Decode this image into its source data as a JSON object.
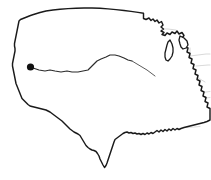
{
  "figure": {
    "name": "us-contiguous-map",
    "background_color": "#ffffff",
    "width": 211,
    "height": 180
  },
  "style": {
    "national_outline_color": "#1a1a1a",
    "state_border_color": "#c9c9c9",
    "marker_color": "#111111",
    "route_color": "#2b2b2b",
    "route_color_faint": "#5c5c5c",
    "lake_outline_color": "#1a1a1a"
  },
  "markers": [
    {
      "name": "location-dot",
      "label": "",
      "x": 30.5,
      "y": 67.0,
      "radius": 3.6,
      "color": "#111111"
    }
  ],
  "routes": [
    {
      "name": "eastward-route",
      "label": "",
      "color": "#2b2b2b",
      "points": "33,68 39,70 45,71 50,70 55,71 61,72 67,71 72,72 78,72 83,71 88,70 93,65 97,61 101,59 106,57 110,55 115,55 119,56 124,58 128,60 132,61"
    },
    {
      "name": "eastward-route-tail",
      "label": "",
      "color": "#5c5c5c",
      "points": "132,61 137,64 142,67 147,70 151,73 155,76"
    }
  ],
  "geography": {
    "national_outline": "M 33.5,14.5 L 40,12.5 L 46,11.0 L 53,10.0 L 60,9.2 L 68,8.6 L 76,8.2 L 84,8.0 L 92,8.0 L 100,8.3 L 108,8.9 L 116,9.6 L 124,10.5 L 131,11.4 L 138,12.4 L 143.5,13.2 L 143.5,18.5 L 146,19.5 L 149,18.0 L 151,20.5 L 153,19.0 L 155,21.5 L 157,20.0 L 159,23.0 L 161.5,21.5 L 163,25.0 L 161,27.0 L 163.5,29.0 L 161,31.0 L 164,32.5 L 162,34.5 L 165,35.5 L 167,33.0 L 170,34.5 L 172,32.0 L 175,33.5 L 177,31.0 L 179,34.0 L 182,32.5 L 184,35.5 L 182,38.0 L 184.5,39.5 L 183,42.5 L 186,43.5 L 185,47.0 L 188,48.0 L 187,52.0 L 190,53.5 L 189,57.5 L 192,59.0 L 191,63.0 L 194,64.5 L 193,68.5 L 196,70.0 L 195,74.0 L 198,75.5 L 197,79.5 L 200,81.0 L 199,85.0 L 202,86.5 L 201,90.5 L 204,92.0 L 203,96.0 L 206,97.5 L 205,101.5 L 208,103.0 L 207,107.0 L 210,108.5 L 210,120.0 L 207,121.5 L 204,122.5 L 200,123.5 L 196,124.5 L 192,125.5 L 188,126.5 L 184,127.5 L 181,128.5 L 179,129.5 L 177,128.5 L 175,130.0 L 173,128.5 L 171,130.5 L 169,129.0 L 167,131.0 L 165,129.5 L 163,131.5 L 161,130.0 L 159,132.0 L 157,130.5 L 155,132.0 L 153,133.5 L 151,132.5 L 149,134.0 L 147,133.0 L 145,134.5 L 143,133.5 L 141,134.5 L 139,133.5 L 137,134.0 L 135,133.0 L 133,133.5 L 131,132.5 L 129,133.0 L 127,132.0 L 125,132.5 L 123,133.5 L 121,135.0 L 119,136.5 L 117,138.0 L 115,139.5 L 114,142.0 L 113,145.0 L 112,148.0 L 111,151.0 L 110,154.0 L 109,157.0 L 108,160.0 L 107,163.0 L 106,165.5 L 104.5,167.5 L 103,165.0 L 101.5,162.0 L 100,159.0 L 99,156.0 L 97.5,153.5 L 96,151.5 L 94,150.5 L 92,150.0 L 90,149.0 L 88,147.5 L 86,145.5 L 84.5,143.0 L 83,140.5 L 81.5,138.0 L 80,135.5 L 78,134.0 L 76,133.0 L 74,132.0 L 72,130.5 L 70,129.0 L 68,127.0 L 66,125.0 L 64,123.0 L 62,121.0 L 60,119.5 L 58,118.0 L 56,116.5 L 54,115.0 L 52,113.5 L 50,112.0 L 48,111.0 L 46,110.0 L 44,109.5 L 42,109.0 L 40,108.5 L 38,108.0 L 36,107.5 L 34,107.0 L 32,106.5 L 30,106.0 L 28,104.5 L 26,102.5 L 24,100.5 L 22,98.5 L 21,96.0 L 20,93.5 L 19,91.0 L 18,88.5 L 17,86.0 L 16,83.5 L 15.5,81.0 L 15,78.5 L 14.5,76.0 L 14,73.5 L 13.5,71.0 L 13,68.5 L 12.5,66.0 L 12.5,63.5 L 13,61.0 L 13.5,58.5 L 14,56.0 L 14.5,53.5 L 15,51.0 L 15,48.5 L 14.5,46.0 L 14.5,43.5 L 15,41.0 L 15.5,38.5 L 16,36.0 L 16.5,33.5 L 17,31.0 L 17.5,28.5 L 18,26.0 L 18.5,23.5 L 19,21.0 L 20.5,19.5 L 23,18.5 L 25.5,17.5 L 28,16.5 L 30.5,15.5 Z",
    "border_lines": [
      {
        "name": "wa-or-border",
        "d": "M 15,41 L 22,40.5 L 30,40 L 38,39.5 L 45,39.2"
      },
      {
        "name": "or-ca-border",
        "d": "M 14,57.5 L 22,57 L 30,56.8 L 38,56.6 L 45,56.4"
      },
      {
        "name": "wa-id-border",
        "d": "M 45,39.2 L 45.5,30 L 46,22 L 46.5,15.5"
      },
      {
        "name": "id-mt-border",
        "d": "M 45,39.2 L 48,38 L 52,36 L 55,33 L 57,29 L 58.5,25 L 59.5,20 L 60,14.5"
      },
      {
        "name": "id-nv-ut-border",
        "d": "M 45,56.4 L 52,56.2 L 59,56 L 66,55.8 L 72,55.6"
      },
      {
        "name": "nv-ca-border",
        "d": "M 45,56.4 L 42,63 L 39,69 L 36,76 L 33,82 L 30,89 L 27,95 L 25,100"
      },
      {
        "name": "nv-ut-border",
        "d": "M 72,55.6 L 72,64 L 72,72 L 72,80 L 72,88"
      },
      {
        "name": "ut-az-border",
        "d": "M 72,88 L 66,88.2 L 60,88.4 L 54,88.6 L 48,88.8"
      },
      {
        "name": "az-nm-border",
        "d": "M 72,88 L 72,96 L 72,104 L 72,112"
      },
      {
        "name": "mt-wy-border",
        "d": "M 58,55.8 L 66,55.8 L 74,55.6 L 82,55.4 L 90,55.2 L 98,55"
      },
      {
        "name": "wy-co-border",
        "d": "M 72,88 L 80,88 L 88,88 L 96,88 L 103,88"
      },
      {
        "name": "wy-sd-ne-border",
        "d": "M 103,55 L 103,63 L 103,71 L 103,79 L 103,88"
      },
      {
        "name": "mt-nd-border",
        "d": "M 98,55 L 98,47 L 98,39 L 98,31 L 98,23 L 98,13.5"
      },
      {
        "name": "nd-sd-border",
        "d": "M 98,39 L 106,39 L 114,39 L 122,39 L 130,39.5"
      },
      {
        "name": "sd-ne-border",
        "d": "M 103,55 L 111,55.5 L 119,56 L 127,56.5 L 134,57"
      },
      {
        "name": "ne-ks-border",
        "d": "M 103,72 L 111,72.5 L 119,73 L 127,73.5 L 135,74"
      },
      {
        "name": "ks-ok-border",
        "d": "M 103,88 L 111,88.5 L 119,89 L 127,89.5 L 135,90"
      },
      {
        "name": "ok-tx-border",
        "d": "M 103,102 L 110,102.5 L 117,103 L 124,103.5 L 131,104"
      },
      {
        "name": "nm-tx-border",
        "d": "M 88,102 L 88,110 L 88,118 L 88,124"
      },
      {
        "name": "nm-co-border",
        "d": "M 72,104 L 80,104 L 88,104 L 96,104"
      },
      {
        "name": "co-ks-border",
        "d": "M 103,88 L 103,96 L 103,104"
      },
      {
        "name": "ok-nm-border",
        "d": "M 96,104 L 96,96 L 96,90"
      },
      {
        "name": "nd-mn-border",
        "d": "M 130,39.5 L 130,31 L 130,23 L 130,15"
      },
      {
        "name": "sd-mn-ia-border",
        "d": "M 134,57 L 134,49 L 134,42 L 133,39.5"
      },
      {
        "name": "ia-mo-border",
        "d": "M 135,74 L 143,73.5 L 151,73 L 156,72.5"
      },
      {
        "name": "mn-ia-border",
        "d": "M 134,57 L 142,57 L 150,57 L 156,57"
      },
      {
        "name": "ia-il-border",
        "d": "M 156,57 L 157,65 L 157,72.5"
      },
      {
        "name": "mo-ar-border",
        "d": "M 135,90 L 143,90 L 151,90 L 158,90"
      },
      {
        "name": "mo-il-ky-border",
        "d": "M 157,72.5 L 158,80 L 158,88 L 158,90"
      },
      {
        "name": "ar-la-border",
        "d": "M 137,104 L 144,104 L 151,104 L 157,104"
      },
      {
        "name": "la-ms-border",
        "d": "M 157,104 L 158,112 L 158,120 L 158,126"
      },
      {
        "name": "ms-al-border",
        "d": "M 168,104 L 168,112 L 168,120 L 168,128"
      },
      {
        "name": "ar-ms-tn-border",
        "d": "M 158,90 L 166,90 L 174,90 L 181,90"
      },
      {
        "name": "al-ga-border",
        "d": "M 178,104 L 178,112 L 178,120 L 178,128"
      },
      {
        "name": "tn-al-ms-border",
        "d": "M 158,100 L 166,100 L 174,100 L 182,100"
      },
      {
        "name": "ky-tn-border",
        "d": "M 158,82 L 166,82 L 174,82 L 182,82 L 190,82"
      },
      {
        "name": "tn-nc-border",
        "d": "M 182,82 L 186,86 L 190,90 L 194,94"
      },
      {
        "name": "il-in-border",
        "d": "M 167,57 L 167,65 L 167,73 L 167,80"
      },
      {
        "name": "in-oh-border",
        "d": "M 178,53 L 178,61 L 178,69 L 178,77"
      },
      {
        "name": "oh-pa-wv-border",
        "d": "M 190,48 L 190,56 L 190,64 L 190,72"
      },
      {
        "name": "wi-il-border",
        "d": "M 152,52 L 160,52 L 167,52"
      },
      {
        "name": "mn-wi-border",
        "d": "M 145,25 L 147,32 L 149,39 L 151,46 L 152,52"
      },
      {
        "name": "wi-mi-border",
        "d": "M 152,36 L 160,35 L 166,34"
      },
      {
        "name": "mi-in-oh-border",
        "d": "M 167,53 L 175,53 L 183,53 L 190,53"
      },
      {
        "name": "va-nc-border",
        "d": "M 194,94 L 200,93 L 206,92 L 210,91.5"
      },
      {
        "name": "sc-nc-border",
        "d": "M 194,100 L 200,99 L 206,98 L 210,97.5"
      },
      {
        "name": "ga-sc-border",
        "d": "M 188,104 L 193,101 L 198,99 L 202,98"
      },
      {
        "name": "wv-va-border",
        "d": "M 190,72 L 195,76 L 200,79 L 205,82"
      },
      {
        "name": "pa-ny-border",
        "d": "M 190,56 L 198,55 L 206,54 L 210,54"
      },
      {
        "name": "md-pa-border",
        "d": "M 196,66 L 202,65.5 L 208,65 L 210,65"
      },
      {
        "name": "ga-fl-border",
        "d": "M 178,128 L 186,127.5 L 194,127 L 200,126.5"
      },
      {
        "name": "mt-internal-1",
        "d": "M 60,14.5 L 61,22 L 62,30 L 63,38 L 64,45 L 64.5,52"
      },
      {
        "name": "mt-internal-2",
        "d": "M 64.5,52 L 72,53 L 80,54 L 88,54.5 L 98,55"
      },
      {
        "name": "ut-co-border",
        "d": "M 88,55 L 88,64 L 88,72 L 88,80 L 88,88"
      },
      {
        "name": "ca-az-border",
        "d": "M 48,88.8 L 44,94 L 40,99 L 36,104 L 32,107"
      },
      {
        "name": "or-id-border",
        "d": "M 45,39.2 L 45,47 L 45,56.4"
      },
      {
        "name": "nv-internal",
        "d": "M 45,56.4 L 50,62 L 55,68 L 60,74 L 65,80 L 72,88"
      },
      {
        "name": "tx-la-border",
        "d": "M 157,104 L 155,112 L 153,120 L 152,127"
      },
      {
        "name": "ok-ar-border",
        "d": "M 137,90 L 137,97 L 137,104"
      },
      {
        "name": "mi-up-border",
        "d": "M 152,30 L 160,29 L 168,29 L 176,30"
      }
    ],
    "lakes": [
      {
        "name": "lake-michigan",
        "d": "M 170,40 L 172,44 L 173,48 L 173,52 L 172,56 L 170,59 L 168,61 L 166,60 L 165,57 L 165,53 L 166,49 L 167,45 L 168,42 Z"
      },
      {
        "name": "lake-huron-erie",
        "d": "M 180,36 L 184,38 L 187,41 L 188,45 L 186,48 L 183,49 L 181,47 L 180,44 L 179,40 Z"
      }
    ]
  },
  "labels": []
}
